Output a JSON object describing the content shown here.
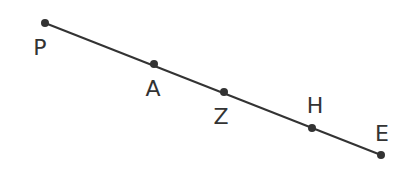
{
  "diagram": {
    "line_color": "#333333",
    "points": [
      {
        "name": "P",
        "x": 45,
        "y": 23,
        "lx": 40,
        "ly": 55
      },
      {
        "name": "A",
        "x": 154,
        "y": 64,
        "lx": 153,
        "ly": 96
      },
      {
        "name": "Z",
        "x": 224,
        "y": 92,
        "lx": 221,
        "ly": 124
      },
      {
        "name": "H",
        "x": 312,
        "y": 128,
        "lx": 315,
        "ly": 113
      },
      {
        "name": "E",
        "x": 381,
        "y": 155,
        "lx": 382,
        "ly": 141
      }
    ]
  }
}
